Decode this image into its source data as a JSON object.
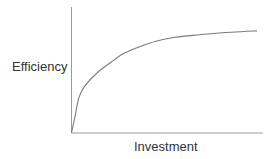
{
  "chart_data": {
    "type": "line",
    "title": "",
    "xlabel": "Investment",
    "ylabel": "Efficiency",
    "xticks": [],
    "yticks": [],
    "grid": false,
    "legend": null,
    "x": [
      0,
      0.02,
      0.04,
      0.07,
      0.14,
      0.23,
      0.28,
      0.36,
      0.46,
      0.56,
      0.69,
      0.86,
      1.0
    ],
    "series": [
      {
        "name": "Efficiency",
        "values": [
          0,
          0.14,
          0.28,
          0.37,
          0.48,
          0.58,
          0.63,
          0.68,
          0.73,
          0.76,
          0.78,
          0.8,
          0.81
        ]
      }
    ],
    "xlim": [
      0,
      1
    ],
    "ylim": [
      0,
      1
    ]
  },
  "colors": {
    "axis": "#9a9a9a",
    "curve": "#7a7a7a",
    "text": "#333333"
  }
}
